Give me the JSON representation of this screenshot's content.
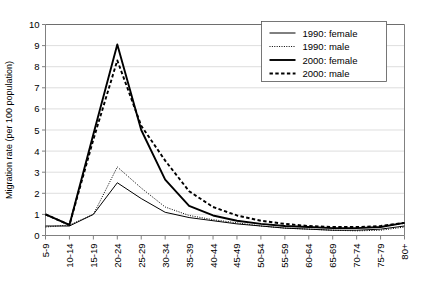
{
  "chart_data": {
    "type": "line",
    "title": "",
    "xlabel": "",
    "ylabel": "Migration rate (per 100 population)",
    "ylim": [
      0,
      10
    ],
    "ytick_labels": [
      "0",
      "1",
      "2",
      "3",
      "4",
      "5",
      "6",
      "7",
      "8",
      "9",
      "10"
    ],
    "yticks": [
      0,
      1,
      2,
      3,
      4,
      5,
      6,
      7,
      8,
      9,
      10
    ],
    "grid": true,
    "legend_position": "top-right",
    "categories": [
      "5-9",
      "10-14",
      "15-19",
      "20-24",
      "25-29",
      "30-34",
      "35-39",
      "40-44",
      "45-49",
      "50-54",
      "55-59",
      "60-64",
      "65-69",
      "70-74",
      "75-79",
      "80+"
    ],
    "series": [
      {
        "name": "1990: female",
        "style": "thin-solid",
        "color": "#000000",
        "values": [
          0.45,
          0.45,
          1.0,
          2.5,
          1.75,
          1.1,
          0.85,
          0.7,
          0.55,
          0.45,
          0.35,
          0.3,
          0.25,
          0.25,
          0.3,
          0.45
        ]
      },
      {
        "name": "1990: male",
        "style": "thin-dotted",
        "color": "#000000",
        "values": [
          0.4,
          0.5,
          1.0,
          3.25,
          2.25,
          1.35,
          0.95,
          0.75,
          0.6,
          0.45,
          0.35,
          0.3,
          0.25,
          0.22,
          0.25,
          0.4
        ]
      },
      {
        "name": "2000: female",
        "style": "thick-solid",
        "color": "#000000",
        "values": [
          1.0,
          0.5,
          4.8,
          9.05,
          5.0,
          2.65,
          1.4,
          0.95,
          0.7,
          0.55,
          0.45,
          0.4,
          0.35,
          0.35,
          0.4,
          0.6
        ]
      },
      {
        "name": "2000: male",
        "style": "thick-dashed",
        "color": "#000000",
        "values": [
          1.0,
          0.5,
          4.55,
          8.3,
          5.2,
          3.55,
          2.1,
          1.35,
          0.95,
          0.7,
          0.55,
          0.45,
          0.4,
          0.4,
          0.45,
          0.6
        ]
      }
    ]
  }
}
